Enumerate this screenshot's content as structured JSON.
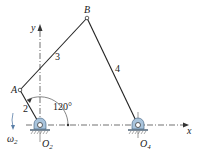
{
  "diagram": {
    "type": "four-bar linkage",
    "axes": {
      "x_label": "x",
      "y_label": "y"
    },
    "joints": {
      "A": {
        "label": "A"
      },
      "B": {
        "label": "B"
      },
      "O2": {
        "label": "O",
        "sub": "2"
      },
      "O4": {
        "label": "O",
        "sub": "4"
      }
    },
    "links": {
      "link2": {
        "label": "2"
      },
      "link3": {
        "label": "3"
      },
      "link4": {
        "label": "4"
      }
    },
    "angle": {
      "label": "120°"
    },
    "angular_velocity": {
      "label": "ω",
      "sub": "2"
    },
    "colors": {
      "line": "#222222",
      "ground": "#7a8a99",
      "pivot_fill": "#a9c4dc",
      "hatch": "#555555"
    }
  }
}
